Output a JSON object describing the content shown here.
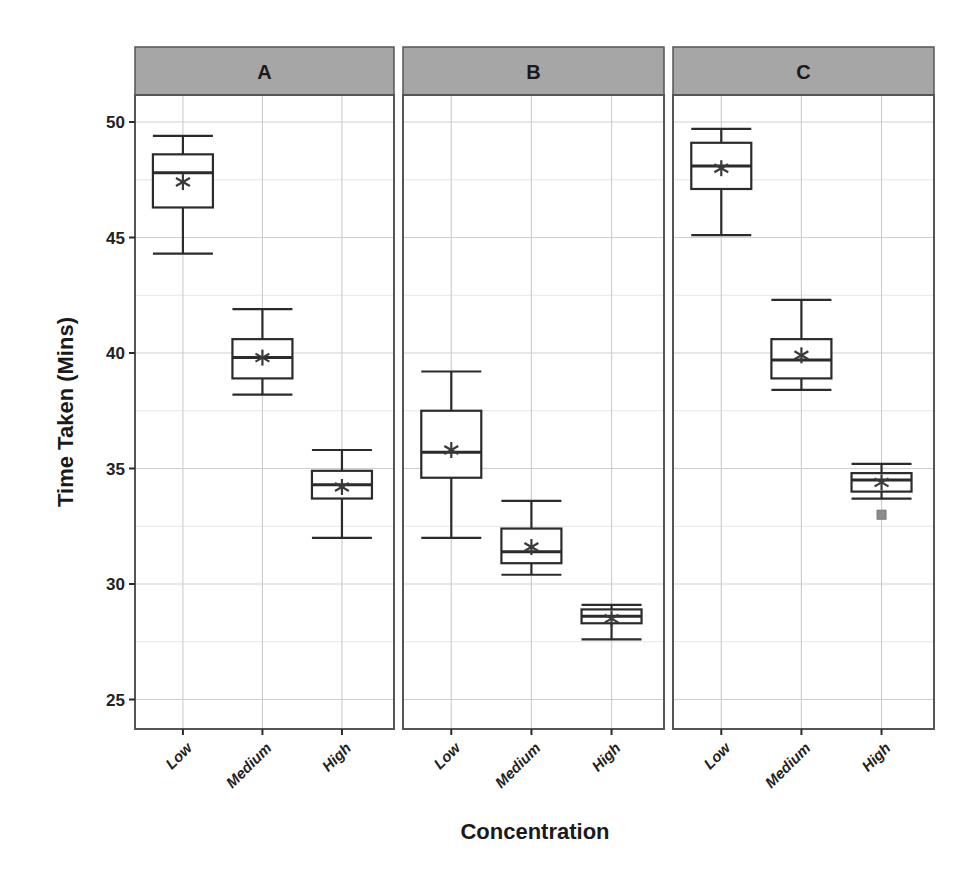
{
  "chart_data": {
    "type": "boxplot",
    "title": "",
    "xlabel": "Concentration",
    "ylabel": "Time Taken (Mins)",
    "ylim": [
      23.8,
      51.5
    ],
    "yticks": [
      25,
      30,
      35,
      40,
      45,
      50
    ],
    "grid": true,
    "legend": null,
    "categories": [
      "Low",
      "Medium",
      "High"
    ],
    "facets": [
      {
        "label": "A",
        "boxes": [
          {
            "category": "Low",
            "whisker_low": 44.3,
            "q1": 46.3,
            "median": 47.8,
            "q3": 48.6,
            "whisker_high": 49.4,
            "mean": 47.4,
            "outliers": []
          },
          {
            "category": "Medium",
            "whisker_low": 38.2,
            "q1": 38.9,
            "median": 39.8,
            "q3": 40.6,
            "whisker_high": 41.9,
            "mean": 39.8,
            "outliers": []
          },
          {
            "category": "High",
            "whisker_low": 32.0,
            "q1": 33.7,
            "median": 34.3,
            "q3": 34.9,
            "whisker_high": 35.8,
            "mean": 34.2,
            "outliers": []
          }
        ]
      },
      {
        "label": "B",
        "boxes": [
          {
            "category": "Low",
            "whisker_low": 32.0,
            "q1": 34.6,
            "median": 35.7,
            "q3": 37.5,
            "whisker_high": 39.2,
            "mean": 35.8,
            "outliers": []
          },
          {
            "category": "Medium",
            "whisker_low": 30.4,
            "q1": 30.9,
            "median": 31.4,
            "q3": 32.4,
            "whisker_high": 33.6,
            "mean": 31.6,
            "outliers": []
          },
          {
            "category": "High",
            "whisker_low": 27.6,
            "q1": 28.3,
            "median": 28.6,
            "q3": 28.9,
            "whisker_high": 29.1,
            "mean": 28.5,
            "outliers": []
          }
        ]
      },
      {
        "label": "C",
        "boxes": [
          {
            "category": "Low",
            "whisker_low": 45.1,
            "q1": 47.1,
            "median": 48.1,
            "q3": 49.1,
            "whisker_high": 49.7,
            "mean": 48.0,
            "outliers": []
          },
          {
            "category": "Medium",
            "whisker_low": 38.4,
            "q1": 38.9,
            "median": 39.7,
            "q3": 40.6,
            "whisker_high": 42.3,
            "mean": 39.9,
            "outliers": []
          },
          {
            "category": "High",
            "whisker_low": 33.7,
            "q1": 34.0,
            "median": 34.5,
            "q3": 34.8,
            "whisker_high": 35.2,
            "mean": 34.4,
            "outliers": [
              33.0
            ]
          }
        ]
      }
    ]
  },
  "colors": {
    "strip_fill": "#a6a6a6",
    "panel_border": "#555555",
    "grid_major": "#cfcfcf",
    "grid_minor": "#e6e6e6",
    "box_stroke": "#2b2b2b",
    "mean_marker": "#3a3a3a",
    "outlier_fill": "#8c8c8c"
  },
  "layout": {
    "panels": [
      {
        "x0": 135,
        "x1": 394
      },
      {
        "x0": 403,
        "x1": 664
      },
      {
        "x0": 673,
        "x1": 934
      }
    ],
    "strip_top": 47,
    "strip_bottom": 95,
    "plot_bottom": 729,
    "y_ref_value": 50,
    "y_ref_px": 122,
    "px_per_unit": 23.1
  }
}
